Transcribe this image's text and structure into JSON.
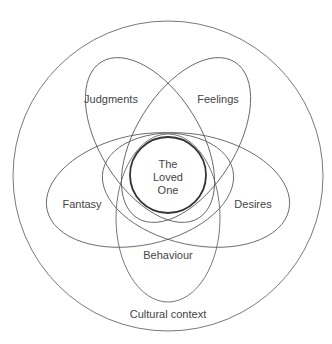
{
  "diagram": {
    "type": "nested-venn",
    "outer_label": "Cultural context",
    "center_label_lines": [
      "The",
      "Loved",
      "One"
    ],
    "petals": [
      {
        "id": "judgments",
        "label": "Judgments"
      },
      {
        "id": "feelings",
        "label": "Feelings"
      },
      {
        "id": "fantasy",
        "label": "Fantasy"
      },
      {
        "id": "desires",
        "label": "Desires"
      },
      {
        "id": "behaviour",
        "label": "Behaviour"
      }
    ],
    "colors": {
      "stroke": "#555555",
      "core_stroke": "#333333",
      "text": "#444444",
      "background": "#ffffff"
    }
  }
}
